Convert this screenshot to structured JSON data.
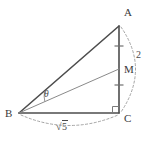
{
  "figure": {
    "type": "geometry-diagram",
    "background_color": "#ffffff",
    "line_color": "#4d4d4d",
    "thin_line_color": "#8a8a8a",
    "dashed_color": "#9a9a9a",
    "label_color": "#3a3a3a"
  },
  "vertices": [
    {
      "id": "A",
      "label": "A",
      "x": 119,
      "y": 26,
      "label_x": 124,
      "label_y": 16
    },
    {
      "id": "B",
      "label": "B",
      "x": 19,
      "y": 113,
      "label_x": 5,
      "label_y": 117
    },
    {
      "id": "C",
      "label": "C",
      "x": 119,
      "y": 113,
      "label_x": 124,
      "label_y": 122
    },
    {
      "id": "M",
      "label": "M",
      "x": 119,
      "y": 69,
      "label_x": 124,
      "label_y": 73
    }
  ],
  "segments": [
    {
      "id": "AB",
      "from": "A",
      "to": "B",
      "style": "solid"
    },
    {
      "id": "AC",
      "from": "A",
      "to": "C",
      "style": "solid"
    },
    {
      "id": "BC",
      "from": "B",
      "to": "C",
      "style": "solid"
    },
    {
      "id": "BM",
      "from": "B",
      "to": "M",
      "style": "thin"
    }
  ],
  "tick_marks": [
    {
      "id": "tick-AM",
      "segment": "AM",
      "x": 119,
      "y": 46
    },
    {
      "id": "tick-MC",
      "segment": "MC",
      "x": 119,
      "y": 85
    }
  ],
  "angles": [
    {
      "id": "theta",
      "label": "θ",
      "at_vertex": "B",
      "between": [
        "BA",
        "BM"
      ],
      "label_x": 44,
      "label_y": 97
    },
    {
      "id": "right-angle-C",
      "label": "",
      "at_vertex": "C",
      "between": [
        "CA",
        "CB"
      ],
      "marker": "square"
    }
  ],
  "measure_labels": [
    {
      "id": "length-AC",
      "text": "2",
      "segment": "AC",
      "arc": "right",
      "x": 136,
      "y": 58
    },
    {
      "id": "length-BC",
      "text": "√5",
      "radicand": "5",
      "segment": "BC",
      "arc": "bottom",
      "x": 63,
      "y": 131
    }
  ],
  "arcs": [
    {
      "id": "arc-AC",
      "from": "A",
      "to": "C",
      "side": "right",
      "style": "dashed"
    },
    {
      "id": "arc-BC",
      "from": "B",
      "to": "C",
      "side": "bottom",
      "style": "dashed"
    }
  ]
}
